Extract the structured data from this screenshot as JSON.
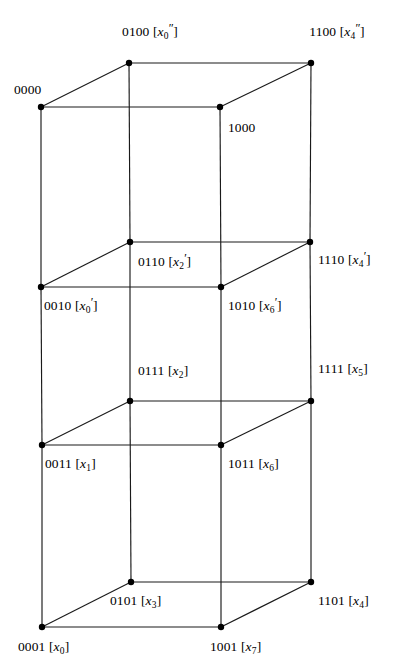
{
  "figure": {
    "kind": "hypercube-lattice-diagram",
    "background_color": "#ffffff",
    "line_color": "#1a1a1a",
    "vertex_color": "#000000",
    "width": 405,
    "height": 670,
    "vertices": [
      {
        "id": "0100",
        "bits": "0100",
        "var": "x",
        "prime": "″",
        "sub": "0",
        "x": 129,
        "y": 63,
        "label_x": 150,
        "label_y": 32,
        "anchor": "center"
      },
      {
        "id": "1100",
        "bits": "1100",
        "var": "x",
        "prime": "″",
        "sub": "4",
        "x": 311,
        "y": 63,
        "label_x": 337,
        "label_y": 32,
        "anchor": "center"
      },
      {
        "id": "0000",
        "bits": "0000",
        "var": "",
        "prime": "",
        "sub": "",
        "x": 41,
        "y": 107,
        "label_x": 14,
        "label_y": 90,
        "anchor": "left"
      },
      {
        "id": "1000",
        "bits": "1000",
        "var": "",
        "prime": "",
        "sub": "",
        "x": 220,
        "y": 107,
        "label_x": 228,
        "label_y": 128,
        "anchor": "left"
      },
      {
        "id": "0110",
        "bits": "0110",
        "var": "x",
        "prime": "′",
        "sub": "2",
        "x": 130,
        "y": 242,
        "label_x": 138,
        "label_y": 262,
        "anchor": "left"
      },
      {
        "id": "1110",
        "bits": "1110",
        "var": "x",
        "prime": "′",
        "sub": "4",
        "x": 310,
        "y": 242,
        "label_x": 318,
        "label_y": 260,
        "anchor": "left"
      },
      {
        "id": "0010",
        "bits": "0010",
        "var": "x",
        "prime": "′",
        "sub": "0",
        "x": 41,
        "y": 287,
        "label_x": 44,
        "label_y": 306,
        "anchor": "left"
      },
      {
        "id": "1010",
        "bits": "1010",
        "var": "x",
        "prime": "′",
        "sub": "6",
        "x": 221,
        "y": 287,
        "label_x": 228,
        "label_y": 306,
        "anchor": "left"
      },
      {
        "id": "0111",
        "bits": "0111",
        "var": "x",
        "prime": "",
        "sub": "2",
        "x": 130,
        "y": 401,
        "label_x": 138,
        "label_y": 372,
        "anchor": "left"
      },
      {
        "id": "1111",
        "bits": "1111",
        "var": "x",
        "prime": "",
        "sub": "5",
        "x": 311,
        "y": 401,
        "label_x": 318,
        "label_y": 370,
        "anchor": "left"
      },
      {
        "id": "0011",
        "bits": "0011",
        "var": "x",
        "prime": "",
        "sub": "1",
        "x": 42,
        "y": 445,
        "label_x": 45,
        "label_y": 465,
        "anchor": "left"
      },
      {
        "id": "1011",
        "bits": "1011",
        "var": "x",
        "prime": "",
        "sub": "6",
        "x": 221,
        "y": 445,
        "label_x": 228,
        "label_y": 465,
        "anchor": "left"
      },
      {
        "id": "0101",
        "bits": "0101",
        "var": "x",
        "prime": "",
        "sub": "3",
        "x": 131,
        "y": 582,
        "label_x": 110,
        "label_y": 602,
        "anchor": "left"
      },
      {
        "id": "1101",
        "bits": "1101",
        "var": "x",
        "prime": "",
        "sub": "4",
        "x": 311,
        "y": 582,
        "label_x": 318,
        "label_y": 602,
        "anchor": "left"
      },
      {
        "id": "0001",
        "bits": "0001",
        "var": "x",
        "prime": "",
        "sub": "0",
        "x": 42,
        "y": 627,
        "label_x": 18,
        "label_y": 648,
        "anchor": "left"
      },
      {
        "id": "1001",
        "bits": "1001",
        "var": "x",
        "prime": "",
        "sub": "7",
        "x": 221,
        "y": 627,
        "label_x": 210,
        "label_y": 648,
        "anchor": "left"
      }
    ],
    "edges": [
      [
        "0100",
        "1100"
      ],
      [
        "0000",
        "1000"
      ],
      [
        "0000",
        "0100"
      ],
      [
        "1000",
        "1100"
      ],
      [
        "0110",
        "1110"
      ],
      [
        "0010",
        "1010"
      ],
      [
        "0010",
        "0110"
      ],
      [
        "1010",
        "1110"
      ],
      [
        "0111",
        "1111"
      ],
      [
        "0011",
        "1011"
      ],
      [
        "0011",
        "0111"
      ],
      [
        "1011",
        "1111"
      ],
      [
        "0101",
        "1101"
      ],
      [
        "0001",
        "1001"
      ],
      [
        "0001",
        "0101"
      ],
      [
        "1001",
        "1101"
      ],
      [
        "0100",
        "0110"
      ],
      [
        "1100",
        "1110"
      ],
      [
        "0000",
        "0010"
      ],
      [
        "1000",
        "1010"
      ],
      [
        "0110",
        "0111"
      ],
      [
        "1110",
        "1111"
      ],
      [
        "0010",
        "0011"
      ],
      [
        "1010",
        "1011"
      ],
      [
        "0111",
        "0101"
      ],
      [
        "1111",
        "1101"
      ],
      [
        "0011",
        "0001"
      ],
      [
        "1011",
        "1001"
      ]
    ]
  }
}
